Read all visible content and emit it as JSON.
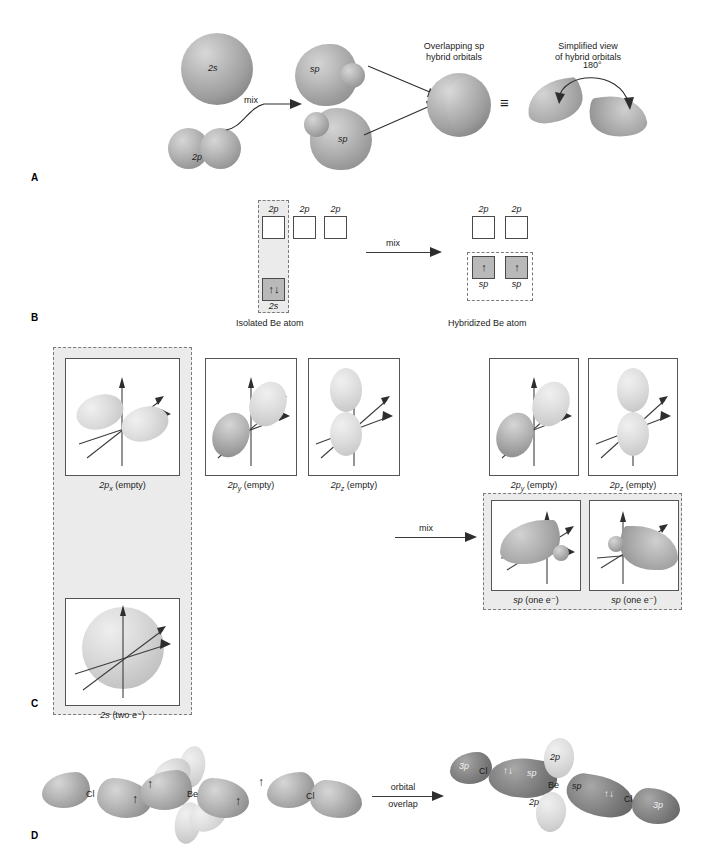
{
  "figure": {
    "panels": [
      "A",
      "B",
      "C",
      "D"
    ]
  },
  "panelA": {
    "letter": "A",
    "orbital_2s": "2s",
    "orbital_2p": "2p",
    "mix_label": "mix",
    "sp_left": "sp",
    "sp_right": "sp",
    "overlap_caption_line1": "Overlapping sp",
    "overlap_caption_line2": "hybrid orbitals",
    "simplified_caption_line1": "Simplified view",
    "simplified_caption_line2": "of hybrid orbitals",
    "angle_label": "180°",
    "equivalence_symbol": "≡"
  },
  "panelB": {
    "letter": "B",
    "mix_label": "mix",
    "isolated_caption": "Isolated Be atom",
    "hybridized_caption": "Hybridized Be atom",
    "isolated": {
      "p_orbitals": [
        {
          "label": "2p",
          "electrons": "",
          "highlighted": true
        },
        {
          "label": "2p",
          "electrons": "",
          "highlighted": false
        },
        {
          "label": "2p",
          "electrons": "",
          "highlighted": false
        }
      ],
      "s_orbital": {
        "label": "2s",
        "electrons": "↑↓",
        "filled": true
      }
    },
    "hybridized": {
      "p_orbitals": [
        {
          "label": "2p",
          "electrons": ""
        },
        {
          "label": "2p",
          "electrons": ""
        }
      ],
      "sp_orbitals": [
        {
          "label": "sp",
          "electrons": "↑"
        },
        {
          "label": "sp",
          "electrons": "↑"
        }
      ]
    }
  },
  "panelC": {
    "letter": "C",
    "mix_label": "mix",
    "left_boxes": [
      {
        "label_main": "2p",
        "label_sub": "x",
        "label_tail": " (empty)",
        "highlighted": true
      },
      {
        "label_main": "2p",
        "label_sub": "y",
        "label_tail": " (empty)",
        "highlighted": false
      },
      {
        "label_main": "2p",
        "label_sub": "z",
        "label_tail": " (empty)",
        "highlighted": false
      }
    ],
    "left_s_box": {
      "label_main": "2s",
      "label_tail": " (two e⁻)",
      "highlighted": true
    },
    "right_p_boxes": [
      {
        "label_main": "2p",
        "label_sub": "y",
        "label_tail": " (empty)"
      },
      {
        "label_main": "2p",
        "label_sub": "z",
        "label_tail": " (empty)"
      }
    ],
    "right_sp_boxes": [
      {
        "label_main": "sp",
        "label_tail": " (one e⁻)"
      },
      {
        "label_main": "sp",
        "label_tail": " (one e⁻)"
      }
    ]
  },
  "panelD": {
    "letter": "D",
    "arrow_line1": "orbital",
    "arrow_line2": "overlap",
    "reactants": {
      "cl_left": "Cl",
      "cl_left_spin": "↑",
      "be": "Be",
      "be_spin_left": "↑",
      "be_spin_right": "↑",
      "cl_right": "Cl",
      "cl_right_spin": "↑"
    },
    "product": {
      "p3_left": "3p",
      "cl_left": "Cl",
      "pair_left": "↑↓",
      "sp_left": "sp",
      "p2_top": "2p",
      "be": "Be",
      "p2_bottom": "2p",
      "sp_right": "sp",
      "pair_right": "↑↓",
      "cl_right": "Cl",
      "p3_right": "3p"
    }
  },
  "colors": {
    "orbital_mid": "#9c9c9c",
    "orbital_light": "#d9d9d9",
    "orbital_dark": "#707070",
    "shade_panel": "#ebebeb",
    "box_fill": "#b9b9b9",
    "dash_border": "#7b7b7b",
    "ink": "#1c1c1c"
  }
}
